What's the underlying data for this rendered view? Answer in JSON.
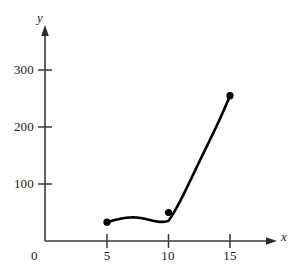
{
  "chart_data": {
    "type": "line",
    "title": "",
    "subtitle": "",
    "xlabel": "x",
    "ylabel": "y",
    "origin_label": "0",
    "x": [
      5,
      10,
      15
    ],
    "values": [
      33,
      50,
      255
    ],
    "series": [
      {
        "name": "curve",
        "x": [
          5,
          10,
          15
        ],
        "values": [
          33,
          50,
          255
        ]
      }
    ],
    "xticks": [
      5,
      10,
      15
    ],
    "xtick_labels": [
      "5",
      "10",
      "15"
    ],
    "yticks": [
      100,
      200,
      300
    ],
    "ytick_labels": [
      "100",
      "200",
      "300"
    ],
    "xlim": [
      0,
      18
    ],
    "ylim": [
      0,
      380
    ],
    "grid": false,
    "legend": false,
    "legend_position": "none",
    "marker": "filled-circle",
    "marker_color": "#000000",
    "line_color": "#000000",
    "axis_color": "#3a3a3a",
    "background_color": "#ffffff",
    "axis_arrows": true,
    "annotations": []
  },
  "figure": {
    "axis": {
      "x_axis_name": "x",
      "y_axis_name": "y",
      "origin_label": "0"
    },
    "y_tick_labels": [
      "300",
      "200",
      "100"
    ],
    "x_tick_labels": [
      "5",
      "10",
      "15"
    ]
  }
}
